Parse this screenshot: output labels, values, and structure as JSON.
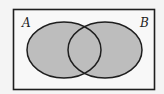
{
  "diagram": {
    "type": "venn",
    "universe_label": "",
    "sets": [
      {
        "name": "A",
        "label": "A"
      },
      {
        "name": "B",
        "label": "B"
      }
    ],
    "shaded_region": "A ∪ B",
    "colors": {
      "background": "#f4f4f4",
      "universe_fill": "#f8f8f8",
      "shade": "#bdbdbd",
      "stroke": "#1e1e1e"
    }
  }
}
